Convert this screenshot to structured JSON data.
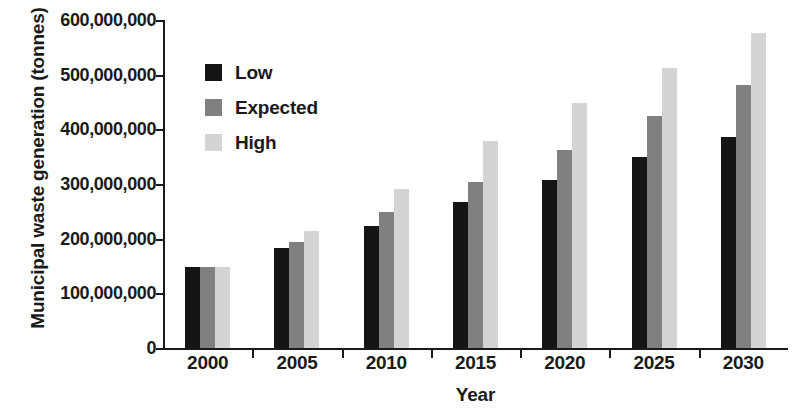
{
  "chart_data": {
    "type": "bar",
    "title": "",
    "xlabel": "Year",
    "ylabel": "Municipal waste generation (tonnes)",
    "categories": [
      "2000",
      "2005",
      "2010",
      "2015",
      "2020",
      "2025",
      "2030"
    ],
    "series": [
      {
        "name": "Low",
        "color": "#151515",
        "values": [
          148000000,
          183000000,
          223000000,
          267000000,
          307000000,
          350000000,
          386000000
        ]
      },
      {
        "name": "Expected",
        "color": "#808080",
        "values": [
          148000000,
          194000000,
          248000000,
          304000000,
          363000000,
          425000000,
          482000000
        ]
      },
      {
        "name": "High",
        "color": "#d4d4d4",
        "values": [
          148000000,
          214000000,
          290000000,
          379000000,
          448000000,
          513000000,
          577000000
        ]
      }
    ],
    "ylim": [
      0,
      600000000
    ],
    "ytick_values": [
      0,
      100000000,
      200000000,
      300000000,
      400000000,
      500000000,
      600000000
    ],
    "ytick_labels": [
      "0",
      "100,000,000",
      "200,000,000",
      "300,000,000",
      "400,000,000",
      "500,000,000",
      "600,000,000"
    ],
    "grid": false,
    "legend_position": "upper-left-inside",
    "legend": [
      {
        "label": "Low",
        "color": "#151515"
      },
      {
        "label": "Expected",
        "color": "#808080"
      },
      {
        "label": "High",
        "color": "#d4d4d4"
      }
    ]
  }
}
